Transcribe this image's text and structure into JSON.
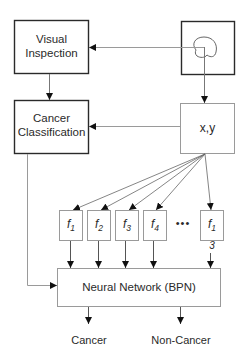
{
  "diagram": {
    "nodes": {
      "visual_inspection": {
        "line1": "Visual",
        "line2": "Inspection"
      },
      "image": {
        "icon": "lesion-outline-icon"
      },
      "cancer_classification": {
        "line1": "Cancer",
        "line2": "Classification"
      },
      "xy": {
        "label": "x,y"
      },
      "features": [
        {
          "base": "f",
          "sub": "1"
        },
        {
          "base": "f",
          "sub": "2"
        },
        {
          "base": "f",
          "sub": "3"
        },
        {
          "base": "f",
          "sub": "4"
        },
        {
          "base": "f",
          "sub": "1",
          "sub_wrap": "3"
        }
      ],
      "ellipsis": "•••",
      "neural_network": {
        "label": "Neural Network (BPN)"
      }
    },
    "outputs": [
      "Cancer",
      "Non-Cancer"
    ],
    "edges": [
      {
        "from": "image",
        "to": "visual_inspection"
      },
      {
        "from": "image",
        "to": "xy"
      },
      {
        "from": "visual_inspection",
        "to": "cancer_classification"
      },
      {
        "from": "xy",
        "to": "cancer_classification"
      },
      {
        "from": "xy",
        "to": "features"
      },
      {
        "from": "features",
        "to": "neural_network"
      },
      {
        "from": "cancer_classification",
        "to": "neural_network"
      },
      {
        "from": "neural_network",
        "to": "outputs"
      }
    ],
    "colors": {
      "stroke_dark": "#2a2a2a",
      "stroke_light": "#9a9a9a",
      "background": "#ffffff"
    }
  }
}
